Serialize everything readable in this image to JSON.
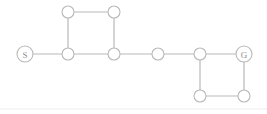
{
  "diagram": {
    "canvas": {
      "width": 267,
      "height": 114,
      "background": "#ffffff"
    },
    "style": {
      "node_stroke": "#b9b9b9",
      "node_fill": "#ffffff",
      "edge_stroke": "#b9b9b9",
      "label_color": "#8e8e8e",
      "node_radius": 6,
      "terminal_node_radius": 8,
      "rule_color": "#ededed"
    },
    "nodes": [
      {
        "id": "s",
        "label": "S",
        "x": 25,
        "y": 54,
        "r": 8,
        "role": "start"
      },
      {
        "id": "n1",
        "label": "",
        "x": 68,
        "y": 12,
        "r": 6,
        "role": "plain"
      },
      {
        "id": "n2",
        "label": "",
        "x": 114,
        "y": 12,
        "r": 6,
        "role": "plain"
      },
      {
        "id": "n3",
        "label": "",
        "x": 68,
        "y": 54,
        "r": 6,
        "role": "plain"
      },
      {
        "id": "n4",
        "label": "",
        "x": 114,
        "y": 54,
        "r": 6,
        "role": "plain"
      },
      {
        "id": "n5",
        "label": "",
        "x": 158,
        "y": 54,
        "r": 6,
        "role": "plain"
      },
      {
        "id": "n6",
        "label": "",
        "x": 200,
        "y": 54,
        "r": 6,
        "role": "plain"
      },
      {
        "id": "g",
        "label": "G",
        "x": 244,
        "y": 54,
        "r": 8,
        "role": "goal"
      },
      {
        "id": "n7",
        "label": "",
        "x": 200,
        "y": 96,
        "r": 6,
        "role": "plain"
      },
      {
        "id": "n8",
        "label": "",
        "x": 244,
        "y": 96,
        "r": 6,
        "role": "plain"
      }
    ],
    "edges": [
      {
        "id": "e1",
        "from": "s",
        "to": "n3"
      },
      {
        "id": "e2",
        "from": "n3",
        "to": "n1"
      },
      {
        "id": "e3",
        "from": "n1",
        "to": "n2"
      },
      {
        "id": "e4",
        "from": "n2",
        "to": "n4"
      },
      {
        "id": "e5",
        "from": "n3",
        "to": "n4"
      },
      {
        "id": "e6",
        "from": "n4",
        "to": "n5"
      },
      {
        "id": "e7",
        "from": "n5",
        "to": "n6"
      },
      {
        "id": "e8",
        "from": "n6",
        "to": "g"
      },
      {
        "id": "e9",
        "from": "n6",
        "to": "n7"
      },
      {
        "id": "e10",
        "from": "n7",
        "to": "n8"
      },
      {
        "id": "e11",
        "from": "n8",
        "to": "g"
      }
    ],
    "rules": [
      {
        "id": "baseline",
        "x1": 0,
        "y1": 109,
        "x2": 267,
        "y2": 109
      }
    ]
  }
}
